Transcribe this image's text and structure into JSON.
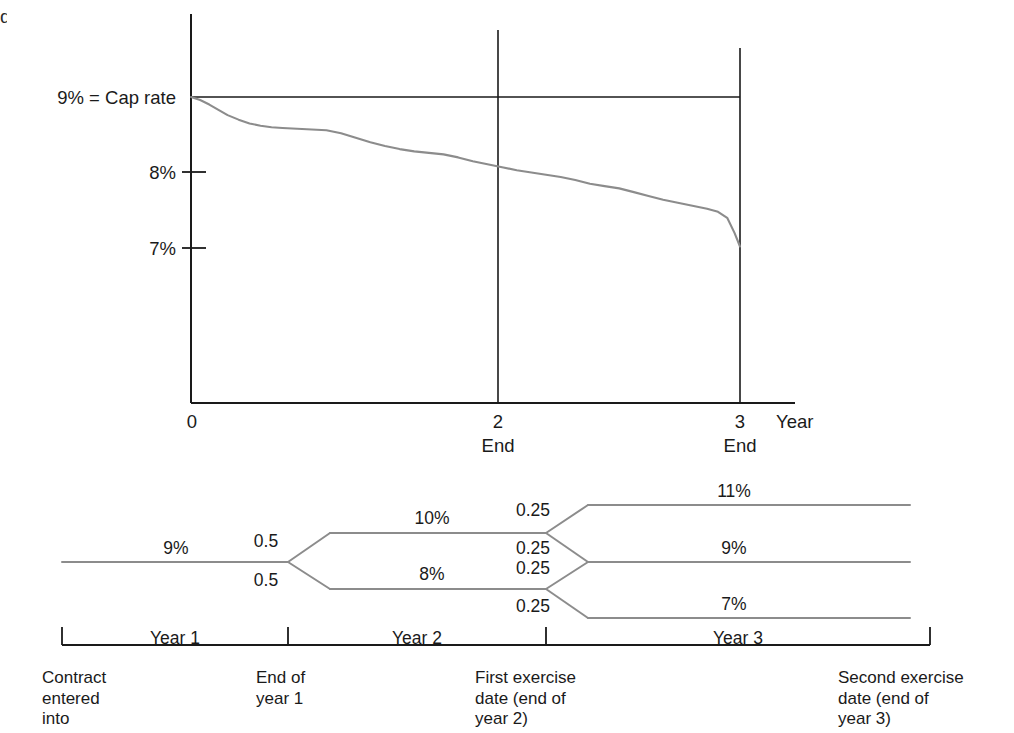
{
  "figure": {
    "edge_fragment": "d"
  },
  "chart_data": {
    "type": "line",
    "title": "",
    "xlabel": "Year",
    "ylabel": "",
    "ylim": [
      6.4,
      9.45
    ],
    "xlim": [
      0,
      3.35
    ],
    "grid": false,
    "legend": null,
    "y_ticks": [
      {
        "value": 9,
        "label": "9% = Cap rate"
      },
      {
        "value": 8,
        "label": "8%"
      },
      {
        "value": 7,
        "label": "7%"
      }
    ],
    "x_ticks": [
      {
        "value": 0,
        "label": "0",
        "sublabel": ""
      },
      {
        "value": 2,
        "label": "2",
        "sublabel": "End"
      },
      {
        "value": 3,
        "label": "3",
        "sublabel": "End"
      }
    ],
    "axis_end_label": "Year",
    "cap_rate_line": {
      "value": 9,
      "label": "9% = Cap rate",
      "from_x": 0,
      "to_x": 3
    },
    "vertical_markers": [
      2,
      3
    ],
    "series": [
      {
        "name": "Forward rate curve",
        "color": "#8c8c8c",
        "x": [
          0.0,
          0.05,
          0.1,
          0.15,
          0.2,
          0.26,
          0.32,
          0.38,
          0.44,
          0.5,
          0.58,
          0.66,
          0.74,
          0.82,
          0.9,
          0.98,
          1.06,
          1.14,
          1.22,
          1.3,
          1.38,
          1.46,
          1.54,
          1.62,
          1.7,
          1.78,
          1.86,
          1.94,
          2.02,
          2.1,
          2.18,
          2.26,
          2.34,
          2.42,
          2.5,
          2.58,
          2.66,
          2.74,
          2.82,
          2.88,
          2.93,
          2.97,
          3.0
        ],
        "y": [
          9.0,
          8.96,
          8.9,
          8.83,
          8.76,
          8.7,
          8.65,
          8.62,
          8.6,
          8.59,
          8.58,
          8.57,
          8.56,
          8.52,
          8.46,
          8.4,
          8.35,
          8.31,
          8.28,
          8.26,
          8.24,
          8.2,
          8.15,
          8.11,
          8.07,
          8.03,
          8.0,
          7.97,
          7.94,
          7.9,
          7.85,
          7.82,
          7.79,
          7.74,
          7.69,
          7.64,
          7.6,
          7.56,
          7.52,
          7.48,
          7.4,
          7.2,
          7.02
        ]
      }
    ]
  },
  "tree": {
    "root_rate": "9%",
    "level1": {
      "probabilities": [
        "0.5",
        "0.5"
      ],
      "rates": [
        "10%",
        "8%"
      ]
    },
    "level2": {
      "probabilities": [
        "0.25",
        "0.25",
        "0.25",
        "0.25"
      ],
      "rates": [
        "11%",
        "9%",
        "9%",
        "7%"
      ]
    }
  },
  "timeline": {
    "periods": [
      "Year 1",
      "Year 2",
      "Year 3"
    ],
    "events": [
      "Contract\nentered\ninto",
      "End of\nyear 1",
      "First exercise\ndate (end of\nyear 2)",
      "Second exercise\ndate (end of\nyear 3)"
    ],
    "event_lines": [
      [
        "Contract",
        "entered",
        "into"
      ],
      [
        "End of",
        "year 1"
      ],
      [
        "First exercise",
        "date (end of",
        "year 2)"
      ],
      [
        "Second exercise",
        "date (end of",
        "year 3)"
      ]
    ]
  }
}
